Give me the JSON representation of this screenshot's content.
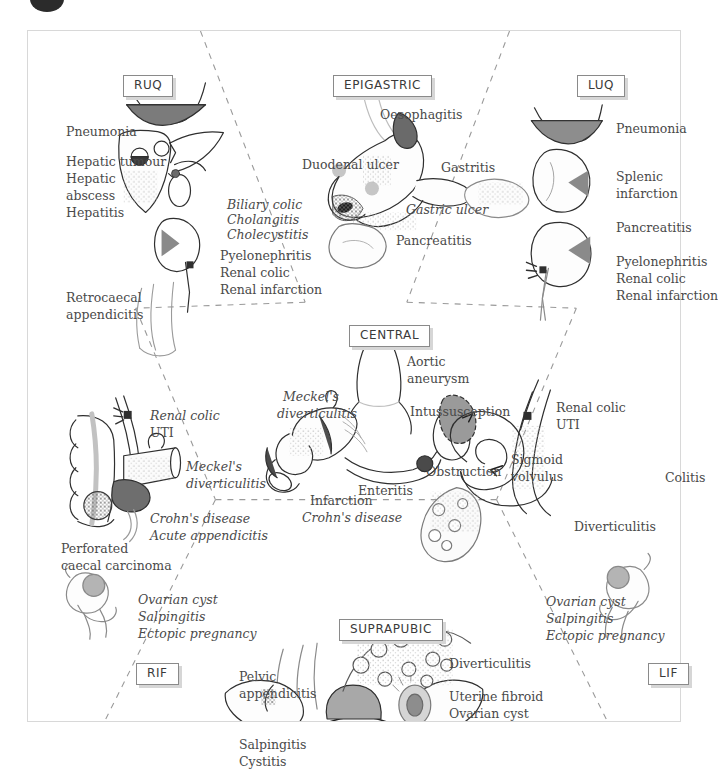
{
  "figure": {
    "frame_color": "#d8d8d8",
    "text_color": "#4a4a4a",
    "divider_style": "dashed",
    "top_marker": "bullet-marker"
  },
  "regions": [
    {
      "id": "ruq",
      "chip": "RUQ",
      "chip_pos": {
        "left": 95,
        "top": 44
      },
      "labels": [
        {
          "text": "Pneumonia",
          "left": 38,
          "top": 92,
          "italic": false
        },
        {
          "text": "Hepatic tumour",
          "left": 38,
          "top": 122,
          "italic": false
        },
        {
          "text": "Hepatic",
          "left": 38,
          "top": 139,
          "italic": false
        },
        {
          "text": "abscess",
          "left": 38,
          "top": 156,
          "italic": false
        },
        {
          "text": "Hepatitis",
          "left": 38,
          "top": 173,
          "italic": false
        },
        {
          "text": "Biliary colic",
          "left": 199,
          "top": 165,
          "italic": true
        },
        {
          "text": "Cholangitis",
          "left": 199,
          "top": 180,
          "italic": true
        },
        {
          "text": "Cholecystitis",
          "left": 199,
          "top": 195,
          "italic": true
        },
        {
          "text": "Pyelonephritis",
          "left": 192,
          "top": 216,
          "italic": false
        },
        {
          "text": "Renal colic",
          "left": 192,
          "top": 233,
          "italic": false
        },
        {
          "text": "Renal infarction",
          "left": 192,
          "top": 250,
          "italic": false
        },
        {
          "text": "Retrocaecal",
          "left": 38,
          "top": 258,
          "italic": false
        },
        {
          "text": "appendicitis",
          "left": 38,
          "top": 275,
          "italic": false
        }
      ]
    },
    {
      "id": "epigastric",
      "chip": "EPIGASTRIC",
      "chip_pos": {
        "left": 305,
        "top": 44
      },
      "labels": [
        {
          "text": "Oesophagitis",
          "left": 352,
          "top": 75,
          "italic": false
        },
        {
          "text": "Duodenal ulcer",
          "left": 274,
          "top": 125,
          "italic": false
        },
        {
          "text": "Gastritis",
          "left": 413,
          "top": 128,
          "italic": false
        },
        {
          "text": "Gastric ulcer",
          "left": 378,
          "top": 170,
          "italic": true
        },
        {
          "text": "Pancreatitis",
          "left": 368,
          "top": 201,
          "italic": false
        }
      ]
    },
    {
      "id": "luq",
      "chip": "LUQ",
      "chip_pos": {
        "left": 549,
        "top": 44
      },
      "labels": [
        {
          "text": "Pneumonia",
          "left": 588,
          "top": 89,
          "italic": false
        },
        {
          "text": "Splenic",
          "left": 588,
          "top": 137,
          "italic": false
        },
        {
          "text": "infarction",
          "left": 588,
          "top": 154,
          "italic": false
        },
        {
          "text": "Pancreatitis",
          "left": 588,
          "top": 188,
          "italic": false
        },
        {
          "text": "Pyelonephritis",
          "left": 588,
          "top": 222,
          "italic": false
        },
        {
          "text": "Renal colic",
          "left": 588,
          "top": 239,
          "italic": false
        },
        {
          "text": "Renal infarction",
          "left": 588,
          "top": 256,
          "italic": false
        }
      ]
    },
    {
      "id": "central",
      "chip": "CENTRAL",
      "chip_pos": {
        "left": 321,
        "top": 294
      },
      "labels": [
        {
          "text": "Aortic",
          "left": 379,
          "top": 322,
          "italic": false
        },
        {
          "text": "aneurysm",
          "left": 379,
          "top": 339,
          "italic": false
        },
        {
          "text": "Meckel's",
          "left": 255,
          "top": 357,
          "italic": true
        },
        {
          "text": "diverticulitis",
          "left": 249,
          "top": 374,
          "italic": true
        },
        {
          "text": "Intussusception",
          "left": 382,
          "top": 372,
          "italic": false
        },
        {
          "text": "Obstruction",
          "left": 398,
          "top": 432,
          "italic": false
        },
        {
          "text": "Enteritis",
          "left": 330,
          "top": 451,
          "italic": false
        },
        {
          "text": "Infarction",
          "left": 282,
          "top": 461,
          "italic": false
        },
        {
          "text": "Crohn's disease",
          "left": 274,
          "top": 478,
          "italic": true
        }
      ]
    },
    {
      "id": "rif-upper",
      "chip": null,
      "labels": [
        {
          "text": "Renal colic",
          "left": 122,
          "top": 376,
          "italic": true
        },
        {
          "text": "UTI",
          "left": 122,
          "top": 393,
          "italic": false
        },
        {
          "text": "Meckel's",
          "left": 158,
          "top": 427,
          "italic": true
        },
        {
          "text": "diverticulitis",
          "left": 158,
          "top": 444,
          "italic": true
        },
        {
          "text": "Crohn's disease",
          "left": 122,
          "top": 479,
          "italic": true
        },
        {
          "text": "Acute appendicitis",
          "left": 122,
          "top": 496,
          "italic": true
        },
        {
          "text": "Perforated",
          "left": 33,
          "top": 509,
          "italic": false
        },
        {
          "text": "caecal carcinoma",
          "left": 33,
          "top": 526,
          "italic": false
        }
      ]
    },
    {
      "id": "lif-upper",
      "chip": null,
      "labels": [
        {
          "text": "Renal colic",
          "left": 528,
          "top": 368,
          "italic": false
        },
        {
          "text": "UTI",
          "left": 528,
          "top": 385,
          "italic": false
        },
        {
          "text": "Sigmoid",
          "left": 483,
          "top": 420,
          "italic": false
        },
        {
          "text": "volvulus",
          "left": 483,
          "top": 437,
          "italic": false
        },
        {
          "text": "Colitis",
          "left": 637,
          "top": 438,
          "italic": false
        },
        {
          "text": "Diverticulitis",
          "left": 546,
          "top": 487,
          "italic": false
        }
      ]
    },
    {
      "id": "rif",
      "chip": "RIF",
      "chip_pos": {
        "left": 108,
        "top": 632
      },
      "labels": [
        {
          "text": "Ovarian cyst",
          "left": 110,
          "top": 560,
          "italic": true
        },
        {
          "text": "Salpingitis",
          "left": 110,
          "top": 577,
          "italic": true
        },
        {
          "text": "Ectopic pregnancy",
          "left": 110,
          "top": 594,
          "italic": true
        }
      ]
    },
    {
      "id": "suprapubic",
      "chip": "SUPRAPUBIC",
      "chip_pos": {
        "left": 311,
        "top": 588
      },
      "labels": [
        {
          "text": "Pelvic",
          "left": 211,
          "top": 637,
          "italic": false
        },
        {
          "text": "appendicitis",
          "left": 211,
          "top": 654,
          "italic": false
        },
        {
          "text": "Diverticulitis",
          "left": 421,
          "top": 624,
          "italic": false
        },
        {
          "text": "Uterine fibroid",
          "left": 421,
          "top": 657,
          "italic": false
        },
        {
          "text": "Ovarian cyst",
          "left": 421,
          "top": 674,
          "italic": false
        },
        {
          "text": "Salpingitis",
          "left": 211,
          "top": 705,
          "italic": false
        },
        {
          "text": "Cystitis",
          "left": 211,
          "top": 722,
          "italic": false
        }
      ]
    },
    {
      "id": "lif",
      "chip": "LIF",
      "chip_pos": {
        "left": 620,
        "top": 632
      },
      "labels": [
        {
          "text": "Ovarian cyst",
          "left": 518,
          "top": 562,
          "italic": true
        },
        {
          "text": "Salpingitis",
          "left": 518,
          "top": 579,
          "italic": true
        },
        {
          "text": "Ectopic pregnancy",
          "left": 518,
          "top": 596,
          "italic": true
        }
      ]
    }
  ]
}
